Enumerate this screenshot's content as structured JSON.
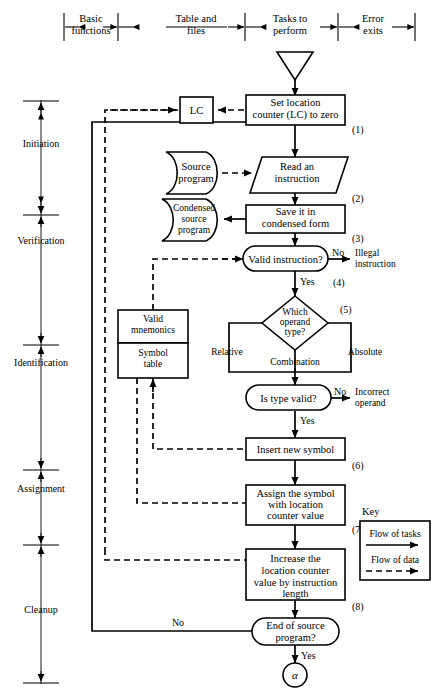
{
  "figure": {
    "colors": {
      "ink": "#000000",
      "paper": "#ffffff"
    }
  },
  "header": {
    "columns": [
      {
        "id": "basic-functions",
        "line1": "Basic",
        "line2": "functions"
      },
      {
        "id": "table-and-files",
        "line1": "Table and",
        "line2": "files"
      },
      {
        "id": "tasks-to-perform",
        "line1": "Tasks to",
        "line2": "perform"
      },
      {
        "id": "error-exits",
        "line1": "Error",
        "line2": "exits"
      }
    ]
  },
  "phases": {
    "items": [
      {
        "id": "initiation",
        "label": "Initiation"
      },
      {
        "id": "verification",
        "label": "Verification"
      },
      {
        "id": "identification",
        "label": "Identification"
      },
      {
        "id": "assignment",
        "label": "Assignment"
      },
      {
        "id": "cleanup",
        "label": "Cleanup"
      }
    ]
  },
  "nodes": {
    "start_connector": {
      "id": "start-connector",
      "label": ""
    },
    "set_lc": {
      "id": "set-location-counter",
      "line1": "Set location",
      "line2": "counter (LC) to zero",
      "step": "(1)"
    },
    "lc_store": {
      "id": "lc-table",
      "label": "LC"
    },
    "read_instruction": {
      "id": "read-an-instruction",
      "line1": "Read an",
      "line2": "instruction",
      "step": "(2)"
    },
    "source_program": {
      "id": "source-program-file",
      "line1": "Source",
      "line2": "program"
    },
    "save_condensed": {
      "id": "save-it-in-condensed-form",
      "line1": "Save it in",
      "line2": "condensed form",
      "step": "(3)"
    },
    "condensed_source": {
      "id": "condensed-source-program-file",
      "line1": "Condensed",
      "line2": "source",
      "line3": "program"
    },
    "valid_instruction": {
      "id": "valid-instruction-decision",
      "label": "Valid  instruction?",
      "step": "(4)",
      "yes": "Yes",
      "no": "No"
    },
    "illegal_instruction": {
      "id": "illegal-instruction-exit",
      "line1": "Illegal",
      "line2": "instruction"
    },
    "which_operand": {
      "id": "which-operand-type-decision",
      "line1": "Which",
      "line2": "operand",
      "line3": "type?",
      "step": "(5)"
    },
    "branch_relative": {
      "id": "branch-relative",
      "label": "Relative"
    },
    "branch_combination": {
      "id": "branch-combination",
      "label": "Combination"
    },
    "branch_absolute": {
      "id": "branch-absolute",
      "label": "Absolute"
    },
    "valid_mnemonics": {
      "id": "valid-mnemonics-table",
      "line1": "Valid",
      "line2": "mnemonics"
    },
    "symbol_table": {
      "id": "symbol-table",
      "line1": "Symbol",
      "line2": "table"
    },
    "is_type_valid": {
      "id": "is-type-valid-decision",
      "label": "Is type valid?",
      "yes": "Yes",
      "no": "No"
    },
    "incorrect_operand": {
      "id": "incorrect-operand-exit",
      "line1": "Incorrect",
      "line2": "operand"
    },
    "insert_symbol": {
      "id": "insert-new-symbol",
      "label": "Insert new symbol",
      "step": "(6)"
    },
    "assign_symbol": {
      "id": "assign-symbol-with-location-counter-value",
      "line1": "Assign the symbol",
      "line2": "with location",
      "line3": "counter value",
      "step": "(7)"
    },
    "increase_lc": {
      "id": "increase-location-counter",
      "line1": "Increase the",
      "line2": "location counter",
      "line3": "value by instruction",
      "line4": "length",
      "step": "(8)"
    },
    "end_of_source": {
      "id": "end-of-source-program-decision",
      "line1": "End of source",
      "line2": "program?",
      "yes": "Yes",
      "no": "No"
    },
    "alpha_connector": {
      "id": "alpha-connector",
      "label": "α"
    }
  },
  "key": {
    "title": "Key",
    "entries": [
      {
        "id": "flow-of-tasks",
        "label": "Flow of tasks",
        "style": "solid"
      },
      {
        "id": "flow-of-data",
        "label": "Flow of data",
        "style": "dashed"
      }
    ]
  }
}
